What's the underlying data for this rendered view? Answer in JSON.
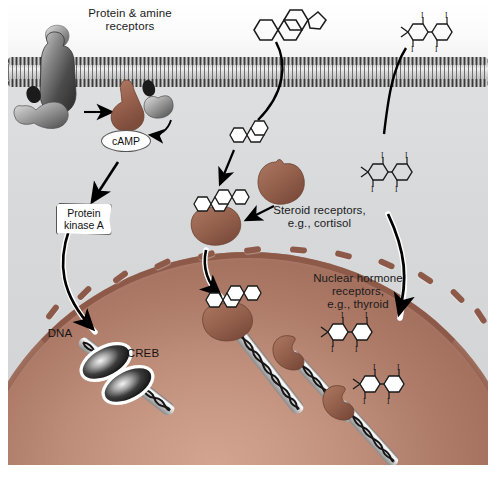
{
  "figure": {
    "background_color": "#ffffff",
    "frame_color": "#e9eaea"
  },
  "regions": {
    "extracellular_label": "",
    "cytoplasm_color": "#d7d8da",
    "nucleus_color": "#bd8d79",
    "membrane_label": ""
  },
  "labels": {
    "protein_amine_receptors": "Protein & amine\nreceptors",
    "protein_amine_line1": "Protein & amine",
    "protein_amine_line2": "receptors",
    "camp": "cAMP",
    "protein_kinase_a_line1": "Protein",
    "protein_kinase_a_line2": "kinase A",
    "dna": "DNA",
    "creb": "CREB",
    "steroid_receptors_line1": "Steroid receptors,",
    "steroid_receptors_line2": "e.g.,  cortisol",
    "nuclear_hormone_line1": "Nuclear hormone",
    "nuclear_hormone_line2": "receptors,",
    "nuclear_hormone_line3": "e.g., thyroid"
  },
  "molecules": {
    "steroid": {
      "name": "steroid-molecule",
      "ring_count": 4,
      "description": "four fused rings (steroid nucleus)"
    },
    "thyroid": {
      "name": "thyroid-hormone-molecule",
      "ring_count": 2,
      "iodine_label": "I",
      "iodine_count": 4,
      "description": "two rings with four iodine substituents"
    }
  },
  "colors": {
    "receptor_brown": "#9b6450",
    "receptor_brown_light": "#b3795f",
    "protein_gray": "#5f5f5f",
    "protein_gray_light": "#9a9a9a",
    "nucleus_brown": "#bd8d79",
    "nuclear_envelope": "#8d5a49",
    "membrane_gray": "#6d6d6d",
    "arrow_black": "#000000",
    "ligand_white": "#ffffff",
    "text": "#1a1a1a"
  },
  "elements": {
    "g_protein_receptor": "G-protein coupled receptor",
    "g_protein_subunits": "G protein subunits",
    "adenylyl_cyclase": "adenylyl cyclase (brown)",
    "steroid_receptor": "cytoplasmic steroid receptor",
    "nuclear_receptor": "nuclear hormone receptor",
    "dna_helix": "DNA double helix",
    "creb_dimer": "CREB dimer on DNA"
  },
  "nuclear_pores": {
    "count": 12,
    "color": "#8d5a49"
  }
}
